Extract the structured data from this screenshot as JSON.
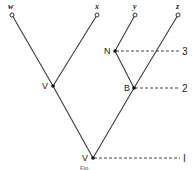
{
  "diagram": {
    "type": "phylogenetic-tree",
    "leaves": [
      {
        "id": "w",
        "label": "w",
        "x": 12,
        "y": 15
      },
      {
        "id": "x",
        "label": "x",
        "x": 97,
        "y": 15
      },
      {
        "id": "y",
        "label": "y",
        "x": 135,
        "y": 15
      },
      {
        "id": "z",
        "label": "z",
        "x": 178,
        "y": 15
      }
    ],
    "internal_nodes": [
      {
        "id": "V_upper",
        "label": "V",
        "x": 53,
        "y": 86
      },
      {
        "id": "N",
        "label": "N",
        "x": 115,
        "y": 51
      },
      {
        "id": "B",
        "label": "B",
        "x": 134,
        "y": 88
      },
      {
        "id": "V_root",
        "label": "V",
        "x": 93,
        "y": 158
      }
    ],
    "edges": [
      [
        "V_root",
        "V_upper"
      ],
      [
        "V_upper",
        "w"
      ],
      [
        "V_upper",
        "x"
      ],
      [
        "V_root",
        "B"
      ],
      [
        "B",
        "N"
      ],
      [
        "B",
        "z"
      ],
      [
        "N",
        "y"
      ]
    ],
    "levels": [
      {
        "label": "3",
        "from": "N",
        "y": 51
      },
      {
        "label": "2",
        "from": "B",
        "y": 88
      },
      {
        "label": "1",
        "from": "V_root",
        "y": 158
      }
    ],
    "caption": "Fig."
  },
  "labels": {
    "w": "w",
    "x": "x",
    "y": "y",
    "z": "z",
    "v_upper": "V",
    "n": "N",
    "b": "B",
    "v_root": "V",
    "level3": "3",
    "level2": "2",
    "level1": "I",
    "caption": "Fig."
  }
}
